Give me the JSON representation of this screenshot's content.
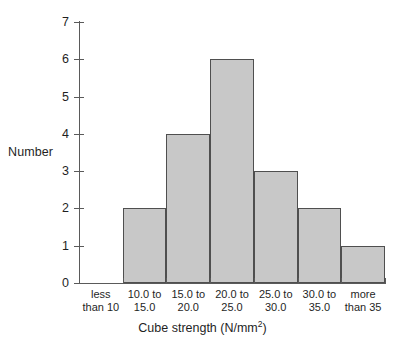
{
  "chart_data": {
    "type": "bar",
    "title": "",
    "subtitle": "",
    "xlabel": "Cube strength (N/mm2)",
    "xlabel_main": "Cube strength (N/mm",
    "xlabel_sup": "2",
    "xlabel_tail": ")",
    "ylabel": "Number",
    "categories": [
      "less\nthan 10",
      "10.0 to\n15.0",
      "15.0 to\n20.0",
      "20.0 to\n25.0",
      "25.0 to\n30.0",
      "30.0 to\n35.0",
      "more\nthan 35"
    ],
    "values": [
      0,
      2,
      4,
      6,
      3,
      2,
      1
    ],
    "ylim": [
      0,
      7
    ],
    "ytick_labels": [
      "0",
      "1",
      "2",
      "3",
      "4",
      "5",
      "6",
      "7"
    ],
    "ytick_values": [
      0,
      1,
      2,
      3,
      4,
      5,
      6,
      7
    ],
    "grid": false,
    "legend": false,
    "legend_position": "none"
  },
  "style": {
    "bar_fill": "#c8c8c8",
    "bar_border": "#4f4f4f",
    "axis_color": "#5a5a5a",
    "text_color": "#1f1f1f",
    "background": "#ffffff"
  }
}
